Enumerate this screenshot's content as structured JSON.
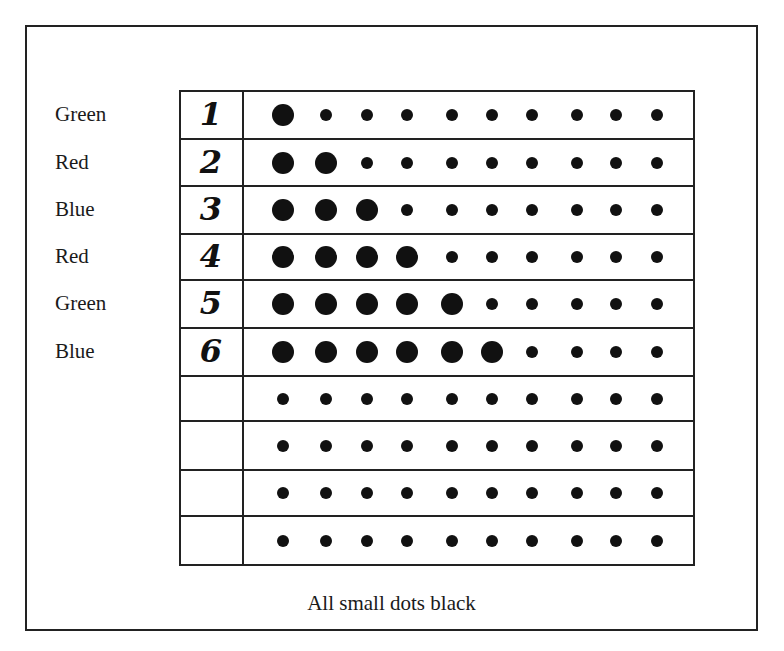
{
  "diagram": {
    "caption": "All small dots black",
    "rows": [
      {
        "label": "Green",
        "number": "1",
        "big_count": 1
      },
      {
        "label": "Red",
        "number": "2",
        "big_count": 2
      },
      {
        "label": "Blue",
        "number": "3",
        "big_count": 3
      },
      {
        "label": "Red",
        "number": "4",
        "big_count": 4
      },
      {
        "label": "Green",
        "number": "5",
        "big_count": 5
      },
      {
        "label": "Blue",
        "number": "6",
        "big_count": 6
      },
      {
        "label": "",
        "number": "",
        "big_count": 0
      },
      {
        "label": "",
        "number": "",
        "big_count": 0
      },
      {
        "label": "",
        "number": "",
        "big_count": 0
      },
      {
        "label": "",
        "number": "",
        "big_count": 0
      }
    ],
    "dots_per_row": 10,
    "dot_color": "#111111",
    "line_color": "#222222"
  }
}
